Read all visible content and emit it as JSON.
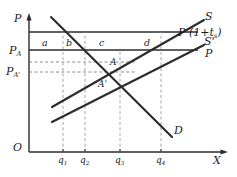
{
  "figure": {
    "type": "economics-supply-demand-tax-diagram",
    "background": "#ffffff",
    "line_color": "#2b2b2b",
    "dash_color": "#8a8a8a"
  },
  "axes": {
    "y_label": "P",
    "x_label": "X",
    "origin_label": "O"
  },
  "price_levels": [
    {
      "id": "p_tax",
      "label_main": "P",
      "label_sub": "A",
      "show_axis_label": false,
      "y": 32
    },
    {
      "id": "p_a",
      "label_main": "P",
      "label_sub": "A",
      "show_axis_label": true,
      "y": 50
    },
    {
      "id": "p_mid",
      "label_main": "",
      "label_sub": "",
      "show_axis_label": false,
      "y": 62
    },
    {
      "id": "p_a_pr",
      "label_main": "P",
      "label_sub": "A'",
      "show_axis_label": true,
      "y": 72
    }
  ],
  "axis_labels": {
    "p_a": {
      "main": "P",
      "sub": "A"
    },
    "p_a_prime": {
      "main": "P",
      "sub": "A'"
    }
  },
  "curves": [
    {
      "id": "supply",
      "label": "S",
      "label_x": 207,
      "label_y": 16
    },
    {
      "id": "supply_prime",
      "label": "S'",
      "label_x": 207,
      "label_y": 41
    },
    {
      "id": "demand",
      "label": "D",
      "label_x": 176,
      "label_y": 142
    },
    {
      "id": "price_plus_tax",
      "label_main": "P",
      "label_paren_open": "(1+",
      "label_t": "t",
      "label_t_sub": "s",
      "label_paren_close": ")",
      "label_x": 178,
      "label_y": 31
    },
    {
      "id": "price_world",
      "label": "P",
      "label_x": 207,
      "label_y": 52
    }
  ],
  "curve_label_texts": {
    "supply": "S",
    "supply_prime": "S'",
    "demand": "D",
    "world_price": "P",
    "tax_price_prefix": "P (1+",
    "tax_price_t": "t",
    "tax_price_t_sub": "s",
    "tax_price_suffix": ")"
  },
  "regions": [
    {
      "id": "a",
      "label": "a",
      "x": 44,
      "y": 44
    },
    {
      "id": "b",
      "label": "b",
      "x": 68,
      "y": 44
    },
    {
      "id": "c",
      "label": "c",
      "x": 101,
      "y": 44
    },
    {
      "id": "d",
      "label": "d",
      "x": 146,
      "y": 44
    }
  ],
  "points": [
    {
      "id": "A",
      "label": "A",
      "x": 111,
      "y": 64
    },
    {
      "id": "A_prime",
      "label": "A'",
      "x": 101,
      "y": 85
    }
  ],
  "x_ticks": [
    {
      "id": "q1",
      "main": "q",
      "sub": "1",
      "x": 63,
      "label_y": 160
    },
    {
      "id": "q2",
      "main": "q",
      "sub": "2",
      "x": 85,
      "label_y": 160
    },
    {
      "id": "q3",
      "main": "q",
      "sub": "3",
      "x": 120,
      "label_y": 160
    },
    {
      "id": "q4",
      "main": "q",
      "sub": "4",
      "x": 161,
      "label_y": 160
    }
  ],
  "geometry": {
    "y_axis_x": 29,
    "x_axis_y": 152,
    "y_axis_top": 14,
    "x_axis_right": 228,
    "horizontal_line_left": 29,
    "horizontal_line_right_tax": 198,
    "horizontal_line_right_world": 198,
    "supply_start": {
      "x": 52,
      "y": 107
    },
    "supply_end": {
      "x": 204,
      "y": 20
    },
    "supply_prime_start": {
      "x": 52,
      "y": 122
    },
    "supply_prime_end": {
      "x": 204,
      "y": 45
    },
    "demand_start": {
      "x": 51,
      "y": 17
    },
    "demand_end": {
      "x": 172,
      "y": 137
    }
  }
}
